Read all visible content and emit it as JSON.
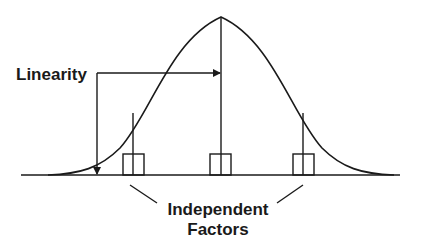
{
  "diagram": {
    "labels": {
      "linearity": "Linearity",
      "factors_line1": "Independent",
      "factors_line2": "Factors"
    },
    "elements": {
      "curve": "bell-curve",
      "baseline": "horizontal-axis",
      "boxes": [
        "left-factor-box",
        "center-factor-box",
        "right-factor-box"
      ]
    },
    "colors": {
      "stroke": "#1a1a1a",
      "background": "#ffffff"
    }
  }
}
